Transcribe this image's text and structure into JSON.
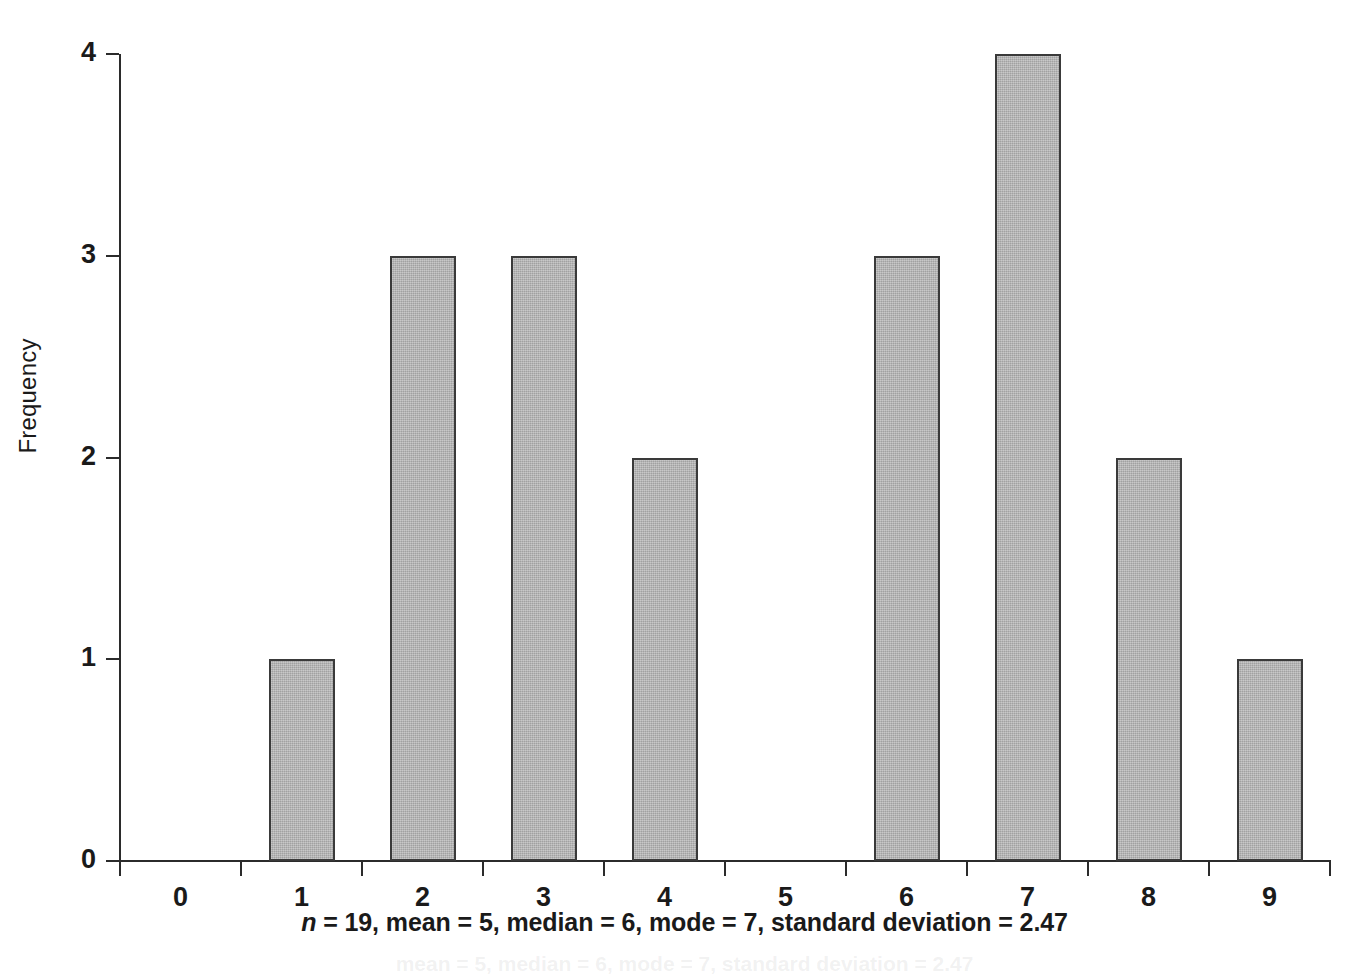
{
  "chart_data": {
    "type": "bar",
    "title": "",
    "subtitle": "",
    "xlabel": "",
    "ylabel": "Frequency",
    "categories": [
      "0",
      "1",
      "2",
      "3",
      "4",
      "5",
      "6",
      "7",
      "8",
      "9"
    ],
    "values": [
      0,
      1,
      3,
      3,
      2,
      0,
      3,
      4,
      2,
      1
    ],
    "series": [
      {
        "name": "Frequency",
        "values": [
          0,
          1,
          3,
          3,
          2,
          0,
          3,
          4,
          2,
          1
        ]
      }
    ],
    "ylim": [
      0,
      4
    ],
    "y_ticks": [
      0,
      1,
      2,
      3,
      4
    ],
    "y_tick_labels": [
      "0",
      "1",
      "2",
      "3",
      "4"
    ],
    "x_tick_labels": [
      "0",
      "1",
      "2",
      "3",
      "4",
      "5",
      "6",
      "7",
      "8",
      "9"
    ],
    "grid": false,
    "legend": false,
    "legend_position": "none",
    "bar_fill_color": "#b3b3b3",
    "bar_border_color": "#3a3a3a",
    "axis_color": "#2b2b2b",
    "background_color": "#ffffff",
    "annotations": [
      "n = 19, mean = 5, median = 6, mode = 7, standard deviation = 2.47"
    ]
  },
  "caption": {
    "n_symbol": "n",
    "text": " = 19, mean = 5, median = 6, mode = 7, standard deviation = 2.47"
  },
  "bleed_through": {
    "text": "mean = 5, median = 6, mode = 7, standard deviation = 2.47"
  }
}
